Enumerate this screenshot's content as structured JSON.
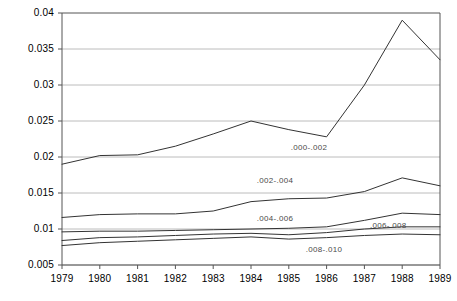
{
  "chart_data": {
    "type": "line",
    "title": "",
    "subtitle": "",
    "xlabel": "",
    "ylabel": "",
    "x": [
      1979,
      1980,
      1981,
      1982,
      1983,
      1984,
      1985,
      1986,
      1987,
      1988,
      1989
    ],
    "xtick_labels": [
      "1979",
      "1980",
      "1981",
      "1982",
      "1983",
      "1984",
      "1985",
      "1986",
      "1987",
      "1988",
      "1989"
    ],
    "ytick_labels": [
      "0.005",
      "0.01",
      "0.015",
      "0.02",
      "0.025",
      "0.03",
      "0.035",
      "0.04"
    ],
    "ytick_values": [
      0.005,
      0.01,
      0.015,
      0.02,
      0.025,
      0.03,
      0.035,
      0.04
    ],
    "ylim": [
      0.005,
      0.04
    ],
    "xlim": [
      1979,
      1989
    ],
    "grid": true,
    "grid_axis": "y",
    "legend": "inline-labels",
    "legend_position": "inline",
    "line_color": "#333333",
    "grid_color": "#b4b4b4",
    "axis_color": "#555555",
    "series": [
      {
        "name": ".000-.002",
        "label": ".000-.002",
        "label_x": 1985.05,
        "label_y": 0.0213,
        "values": [
          0.019,
          0.0202,
          0.0203,
          0.0215,
          0.0232,
          0.025,
          0.0238,
          0.0228,
          0.03,
          0.039,
          0.0335
        ]
      },
      {
        "name": ".002-.004",
        "label": ".002-.004",
        "label_x": 1984.15,
        "label_y": 0.01665,
        "values": [
          0.0116,
          0.012,
          0.0121,
          0.0121,
          0.0125,
          0.0138,
          0.0142,
          0.0143,
          0.0152,
          0.0171,
          0.016
        ]
      },
      {
        "name": ".004-.006",
        "label": ".004-.006",
        "label_x": 1984.15,
        "label_y": 0.01135,
        "values": [
          0.0096,
          0.0097,
          0.0097,
          0.0098,
          0.0099,
          0.01,
          0.0101,
          0.0103,
          0.0112,
          0.0122,
          0.012
        ]
      },
      {
        "name": ".006-.008",
        "label": ".006-.008",
        "label_x": 1987.15,
        "label_y": 0.01045,
        "values": [
          0.0084,
          0.0088,
          0.0089,
          0.0091,
          0.0093,
          0.0094,
          0.0092,
          0.0095,
          0.01,
          0.0103,
          0.0103
        ]
      },
      {
        "name": ".008-.010",
        "label": ".008-.010",
        "label_x": 1985.45,
        "label_y": 0.00705,
        "values": [
          0.0077,
          0.0081,
          0.0083,
          0.0085,
          0.0087,
          0.0089,
          0.0086,
          0.0088,
          0.0091,
          0.0093,
          0.0092
        ]
      }
    ]
  }
}
